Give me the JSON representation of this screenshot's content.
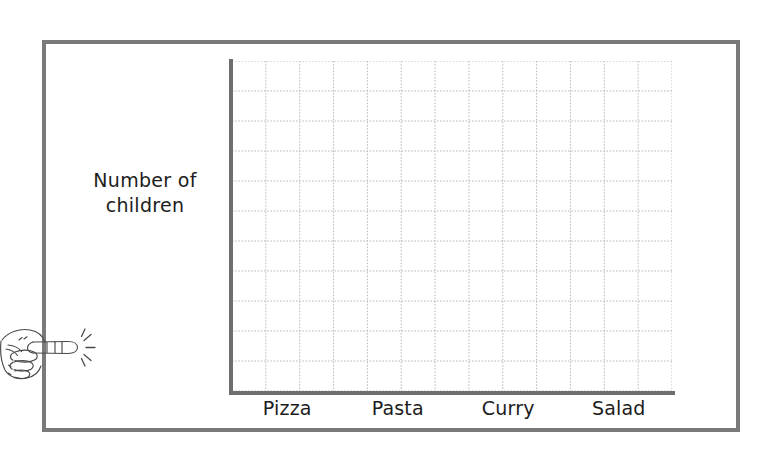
{
  "worksheet": {
    "frame_color": "#7a7a7a",
    "background_color": "#ffffff"
  },
  "chart_data": {
    "type": "bar",
    "title": "",
    "subtitle": "",
    "xlabel": "",
    "ylabel": "Number of children",
    "ylabel_lines": [
      "Number of",
      "children"
    ],
    "categories": [
      "Pizza",
      "Pasta",
      "Curry",
      "Salad"
    ],
    "values": [
      0,
      0,
      0,
      0
    ],
    "series": [
      {
        "name": "Number of children",
        "values": [
          0,
          0,
          0,
          0
        ]
      }
    ],
    "ylim": [
      0,
      11
    ],
    "tick_labels_x": [
      "Pizza",
      "Pasta",
      "Curry",
      "Salad"
    ],
    "tick_labels_y": [],
    "grid": true,
    "grid_rows": 11,
    "grid_columns": 13,
    "grid_line_style": "dotted",
    "grid_color": "#b9b9b9",
    "axis_color": "#6e6e6e",
    "legend": false,
    "legend_position": "none",
    "annotations": [],
    "note": "Empty bar chart template — axes and gridlines drawn, no bars plotted"
  },
  "icons": {
    "pointer_hand": "pointing-hand-icon",
    "sparkle": "sparkle-lines-icon"
  },
  "colors": {
    "ink": "#1c1c1c",
    "frame": "#7a7a7a",
    "axis": "#6e6e6e",
    "grid": "#b9b9b9",
    "paper": "#ffffff"
  }
}
